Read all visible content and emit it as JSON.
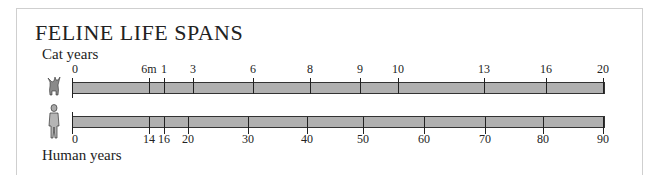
{
  "title": "FELINE LIFE SPANS",
  "cat_label": "Cat years",
  "human_label": "Human years",
  "icons": {
    "cat": "cat-icon",
    "human": "human-figure-icon"
  },
  "colors": {
    "bar_fill": "#b0b0b0",
    "bar_border": "#333333",
    "frame": "#cfcfcf"
  },
  "chart_data": {
    "type": "table",
    "title": "FELINE LIFE SPANS",
    "series": [
      {
        "name": "Cat years",
        "ticks": [
          "0",
          "6m",
          "1",
          "3",
          "6",
          "8",
          "9",
          "10",
          "13",
          "16",
          "20"
        ]
      },
      {
        "name": "Human years",
        "ticks": [
          "0",
          "14",
          "16",
          "20",
          "30",
          "40",
          "50",
          "60",
          "70",
          "80",
          "90"
        ]
      }
    ],
    "cat_tick_positions": [
      72,
      149,
      164,
      193,
      253,
      310,
      360,
      398,
      484,
      546,
      603
    ],
    "human_tick_positions": [
      72,
      149,
      164,
      188,
      248,
      307,
      363,
      424,
      485,
      543,
      603
    ]
  }
}
